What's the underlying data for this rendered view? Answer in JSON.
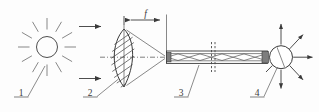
{
  "figure": {
    "background_color": "#fdfdfd",
    "line_color": "#3a3a3a"
  },
  "dimension": {
    "focal_length_label": "f",
    "name": "focal-length"
  },
  "callouts": [
    {
      "id": "1",
      "label": "1",
      "refers_to": "sun-light-source"
    },
    {
      "id": "2",
      "label": "2",
      "refers_to": "converging-lens"
    },
    {
      "id": "3",
      "label": "3",
      "refers_to": "optical-fiber-cable"
    },
    {
      "id": "4",
      "label": "4",
      "refers_to": "light-emitting-output-end"
    }
  ],
  "components": {
    "sun": {
      "name": "sun-icon",
      "ray_count": 12
    },
    "incoming_rays": {
      "name": "incoming-light-arrows",
      "count": 2
    },
    "lens": {
      "name": "biconvex-lens",
      "hatch_lines": 8
    },
    "fiber": {
      "name": "fiber-optic-cable",
      "has_break_symbol": true
    },
    "emitter": {
      "name": "output-emitter",
      "arrow_count": 6
    }
  }
}
